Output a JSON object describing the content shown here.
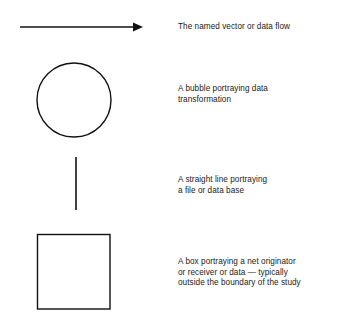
{
  "diagram": {
    "type": "data-flow-diagram-legend",
    "stroke_color": "#111111",
    "background_color": "#ffffff",
    "symbols": [
      {
        "id": "vector",
        "shape": "arrow",
        "description_lines": [
          "The named vector or data flow"
        ]
      },
      {
        "id": "bubble",
        "shape": "circle",
        "description_lines": [
          "A bubble portraying data",
          "transformation"
        ]
      },
      {
        "id": "file",
        "shape": "vertical-line",
        "description_lines": [
          "A straight line portraying",
          "a file or data base"
        ]
      },
      {
        "id": "box",
        "shape": "square",
        "description_lines": [
          "A box portraying a net originator",
          "or receiver or data — typically",
          "outside the boundary of the study"
        ]
      }
    ]
  }
}
